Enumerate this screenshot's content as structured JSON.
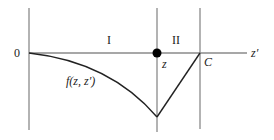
{
  "diagram": {
    "axis_label": "z′",
    "origin_label": "0",
    "region_labels": [
      "I",
      "II"
    ],
    "point_label": "z",
    "boundary_label": "C",
    "curve_label": "f(z, z′)",
    "colors": {
      "axis": "#888888",
      "curve": "#222222",
      "dot": "#000000",
      "text": "#222222"
    }
  }
}
